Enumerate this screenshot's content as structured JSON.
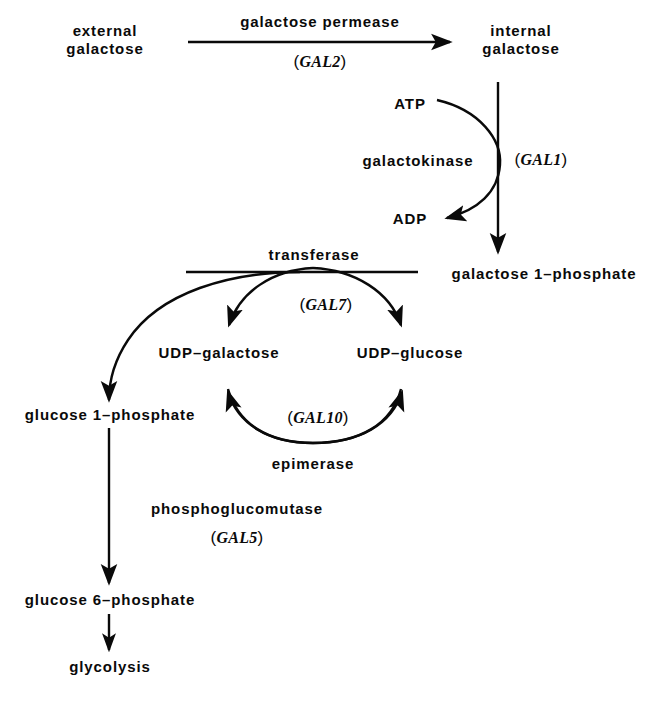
{
  "diagram": {
    "type": "biochemical-pathway",
    "background_color": "#ffffff",
    "ink_color": "#0a0a0a"
  },
  "metabolites": {
    "external_galactose": "external\ngalactose",
    "external_galactose_line1": "external",
    "external_galactose_line2": "galactose",
    "internal_galactose_line1": "internal",
    "internal_galactose_line2": "galactose",
    "galactose_1_phosphate": "galactose 1–phosphate",
    "udp_galactose": "UDP–galactose",
    "udp_glucose": "UDP–glucose",
    "glucose_1_phosphate": "glucose 1–phosphate",
    "glucose_6_phosphate": "glucose 6–phosphate",
    "glycolysis": "glycolysis",
    "atp": "ATP",
    "adp": "ADP"
  },
  "enzymes": {
    "permease": "galactose  permease",
    "galactokinase": "galactokinase",
    "transferase": "transferase",
    "epimerase": "epimerase",
    "phosphoglucomutase": "phosphoglucomutase"
  },
  "genes": {
    "gal2": "GAL2",
    "gal1": "GAL1",
    "gal7": "GAL7",
    "gal10": "GAL10",
    "gal5": "GAL5",
    "open_paren": "(",
    "close_paren": ")"
  }
}
